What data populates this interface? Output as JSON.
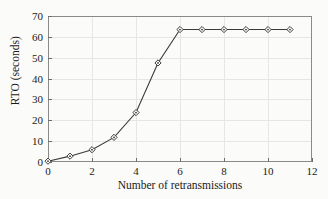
{
  "chart_data": {
    "type": "line",
    "title": "",
    "xlabel": "Number of retransmissions",
    "ylabel": "RTO (seconds)",
    "x": [
      0,
      1,
      2,
      3,
      4,
      5,
      6,
      7,
      8,
      9,
      10,
      11
    ],
    "values": [
      0.4,
      2.8,
      5.9,
      11.8,
      23.7,
      47.5,
      63.5,
      63.5,
      63.5,
      63.5,
      63.5,
      63.5
    ],
    "series": [
      {
        "name": "RTO",
        "values": [
          0.4,
          2.8,
          5.9,
          11.8,
          23.7,
          47.5,
          63.5,
          63.5,
          63.5,
          63.5,
          63.5,
          63.5
        ]
      }
    ],
    "xlim": [
      0,
      12
    ],
    "ylim": [
      0,
      70
    ],
    "xticks": [
      0,
      2,
      4,
      6,
      8,
      10,
      12
    ],
    "yticks": [
      0,
      10,
      20,
      30,
      40,
      50,
      60,
      70
    ],
    "xtick_labels": [
      "0",
      "2",
      "4",
      "6",
      "8",
      "10",
      "12"
    ],
    "ytick_labels": [
      "0",
      "10",
      "20",
      "30",
      "40",
      "50",
      "60",
      "70"
    ],
    "grid": true,
    "legend": false,
    "legend_position": "none",
    "marker": "diamond",
    "line_color": "#3a3a3a",
    "marker_color": "#3a3a3a",
    "grid_color": "#e6e6e6",
    "axis_color": "#8a8a8a",
    "background_color": "#fbfbf9"
  }
}
